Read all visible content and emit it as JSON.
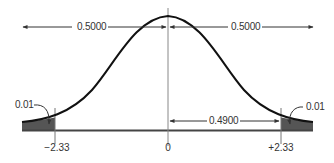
{
  "diagram": {
    "type": "normal-distribution",
    "colors": {
      "curve": "#111111",
      "axis": "#444444",
      "guide": "#888888",
      "shade": "#555555",
      "text": "#333333"
    },
    "labels": {
      "left_half": "0.5000",
      "right_half": "0.5000",
      "middle_area": "0.4900",
      "left_tail": "0.01",
      "right_tail": "0.01"
    },
    "ticks": {
      "left": "−2.33",
      "center": "0",
      "right": "+2.33"
    }
  }
}
